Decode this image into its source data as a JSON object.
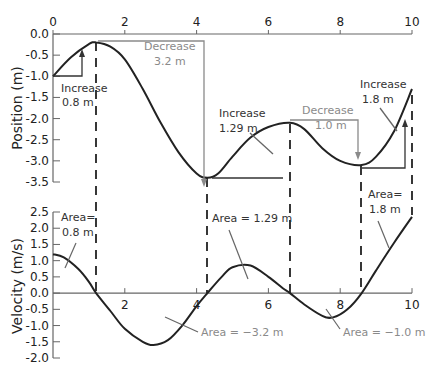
{
  "chart_data": [
    {
      "type": "line",
      "title": "",
      "xlabel": "",
      "ylabel": "Position (m)",
      "xlim": [
        0,
        10
      ],
      "ylim": [
        -3.5,
        0.0
      ],
      "x_ticks": [
        "0",
        "2",
        "4",
        "6",
        "8",
        "10"
      ],
      "y_ticks": [
        "0.0",
        "-0.5",
        "-1.0",
        "-1.5",
        "-2.0",
        "-2.5",
        "-3.0",
        "-3.5"
      ],
      "x_axis_position": "top",
      "grid": false,
      "series": [
        {
          "name": "position",
          "x": [
            0,
            0.5,
            1.0,
            1.2,
            1.6,
            2.0,
            2.5,
            3.0,
            3.5,
            4.0,
            4.3,
            4.6,
            5.0,
            5.5,
            6.0,
            6.6,
            7.0,
            7.5,
            8.0,
            8.6,
            9.0,
            9.5,
            10.0
          ],
          "values": [
            -1.0,
            -0.55,
            -0.24,
            -0.2,
            -0.3,
            -0.6,
            -1.3,
            -2.1,
            -2.8,
            -3.3,
            -3.4,
            -3.3,
            -2.9,
            -2.45,
            -2.2,
            -2.1,
            -2.25,
            -2.7,
            -3.0,
            -3.1,
            -2.9,
            -2.3,
            -1.3
          ]
        }
      ],
      "annotations": [
        {
          "text": [
            "Increase",
            "0.8 m"
          ],
          "color": "#333333"
        },
        {
          "text": [
            "Decrease",
            "3.2 m"
          ],
          "color": "#8a8a8a"
        },
        {
          "text": [
            "Increase",
            "1.29 m"
          ],
          "color": "#333333"
        },
        {
          "text": [
            "Decrease",
            "1.0 m"
          ],
          "color": "#8a8a8a"
        },
        {
          "text": [
            "Increase",
            "1.8 m"
          ],
          "color": "#333333"
        }
      ]
    },
    {
      "type": "line",
      "title": "",
      "xlabel": "",
      "ylabel": "Velocity (m/s)",
      "xlim": [
        0,
        10
      ],
      "ylim": [
        -2.0,
        2.5
      ],
      "x_ticks": [
        "2",
        "4",
        "6",
        "8",
        "10"
      ],
      "y_ticks": [
        "2.5",
        "2.0",
        "1.5",
        "1.0",
        "0.5",
        "0.0",
        "-0.5",
        "-1.0",
        "-1.5",
        "-2.0"
      ],
      "grid": false,
      "series": [
        {
          "name": "velocity",
          "x": [
            0,
            0.3,
            0.7,
            1.0,
            1.2,
            1.6,
            2.0,
            2.5,
            2.8,
            3.2,
            3.6,
            4.0,
            4.3,
            4.7,
            5.0,
            5.5,
            6.0,
            6.4,
            6.6,
            7.0,
            7.5,
            7.8,
            8.2,
            8.6,
            9.0,
            9.5,
            10.0
          ],
          "values": [
            1.2,
            1.1,
            0.75,
            0.35,
            0.0,
            -0.55,
            -1.1,
            -1.5,
            -1.6,
            -1.45,
            -1.0,
            -0.4,
            0.0,
            0.5,
            0.8,
            0.85,
            0.5,
            0.15,
            0.0,
            -0.35,
            -0.7,
            -0.75,
            -0.5,
            0.0,
            0.7,
            1.55,
            2.35
          ]
        }
      ],
      "annotations": [
        {
          "text": [
            "Area=",
            "0.8 m"
          ],
          "color": "#333333"
        },
        {
          "text": [
            "Area = −3.2 m"
          ],
          "color": "#8a8a8a"
        },
        {
          "text": [
            "Area = 1.29 m"
          ],
          "color": "#333333"
        },
        {
          "text": [
            "Area = −1.0 m"
          ],
          "color": "#8a8a8a"
        },
        {
          "text": [
            "Area=",
            "1.8 m"
          ],
          "color": "#333333"
        }
      ]
    }
  ],
  "labels": {
    "pos_axis_title": "Position (m)",
    "vel_axis_title": "Velocity (m/s)",
    "inc1_a": "Increase",
    "inc1_b": "0.8 m",
    "dec1_a": "Decrease",
    "dec1_b": "3.2 m",
    "inc2_a": "Increase",
    "inc2_b": "1.29 m",
    "dec2_a": "Decrease",
    "dec2_b": "1.0 m",
    "inc3_a": "Increase",
    "inc3_b": "1.8 m",
    "area1_a": "Area=",
    "area1_b": "0.8 m",
    "area2": "Area = −3.2 m",
    "area3": "Area = 1.29 m",
    "area4": "Area = −1.0 m",
    "area5_a": "Area=",
    "area5_b": "1.8 m"
  },
  "colors": {
    "curve": "#222222",
    "axis": "#555555",
    "increase": "#333333",
    "decrease": "#8a8a8a"
  }
}
